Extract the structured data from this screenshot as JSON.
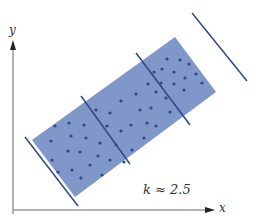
{
  "diagram": {
    "y_axis_label": "y",
    "x_axis_label": "x",
    "annotation": "k ≈ 2.5",
    "colors": {
      "band": "#7f97c9",
      "dots": "#2d4a8a",
      "lines": "#2e4a86",
      "axes": "#555555"
    },
    "band_corners": [
      [
        32,
        140
      ],
      [
        175,
        37
      ],
      [
        216,
        92
      ],
      [
        75,
        197
      ]
    ],
    "cut_lines": [
      [
        [
          25,
          137
        ],
        [
          78,
          206
        ]
      ],
      [
        [
          81,
          96
        ],
        [
          130,
          164
        ]
      ],
      [
        [
          141,
          53
        ],
        [
          190,
          122
        ]
      ],
      [
        [
          192,
          13
        ],
        [
          247,
          81
        ]
      ]
    ]
  }
}
